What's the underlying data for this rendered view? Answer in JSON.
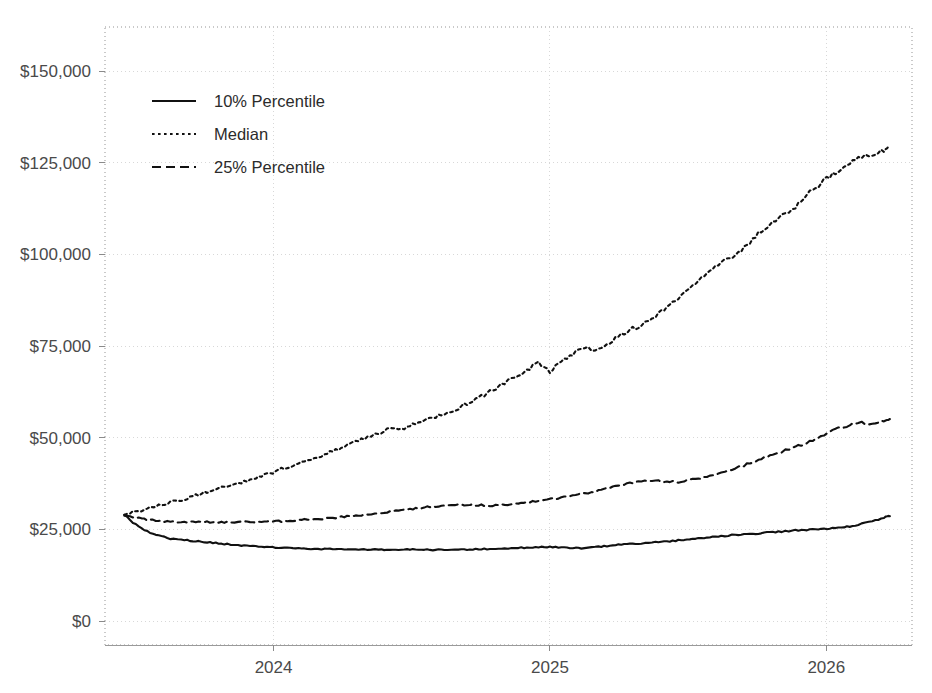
{
  "chart_data": {
    "type": "line",
    "title": "",
    "subtitle": "",
    "xlabel": "",
    "ylabel": "",
    "grid": true,
    "legend_position": "upper-left-inside",
    "x_tick_labels": [
      "2024",
      "2025",
      "2026"
    ],
    "x_tick_values": [
      2024,
      2025,
      2026
    ],
    "xlim": [
      2023.39,
      2026.31
    ],
    "y_tick_labels": [
      "$0",
      "$25,000",
      "$50,000",
      "$75,000",
      "$100,000",
      "$125,000",
      "$150,000"
    ],
    "y_tick_values": [
      0,
      25000,
      50000,
      75000,
      100000,
      125000,
      150000
    ],
    "ylim": [
      -6500,
      162000
    ],
    "y_prefix": "$",
    "x": [
      2023.46,
      2023.5,
      2023.54,
      2023.58,
      2023.62,
      2023.67,
      2023.71,
      2023.75,
      2023.79,
      2023.83,
      2023.88,
      2023.92,
      2023.96,
      2024.0,
      2024.04,
      2024.08,
      2024.12,
      2024.17,
      2024.21,
      2024.25,
      2024.29,
      2024.33,
      2024.38,
      2024.42,
      2024.46,
      2024.5,
      2024.54,
      2024.58,
      2024.62,
      2024.67,
      2024.71,
      2024.75,
      2024.79,
      2024.83,
      2024.88,
      2024.92,
      2024.96,
      2025.0,
      2025.04,
      2025.08,
      2025.12,
      2025.17,
      2025.21,
      2025.25,
      2025.29,
      2025.33,
      2025.38,
      2025.42,
      2025.46,
      2025.5,
      2025.54,
      2025.58,
      2025.62,
      2025.67,
      2025.71,
      2025.75,
      2025.79,
      2025.83,
      2025.88,
      2025.92,
      2025.96,
      2026.0,
      2026.04,
      2026.08,
      2026.12,
      2026.17,
      2026.21,
      2026.23
    ],
    "series": [
      {
        "name": "10% Percentile",
        "style": "solid",
        "color": "#111111",
        "values": [
          29000,
          26400,
          24600,
          23400,
          22600,
          22200,
          21900,
          21600,
          21300,
          21000,
          20700,
          20500,
          20300,
          20100,
          19950,
          19800,
          19750,
          19700,
          19700,
          19650,
          19600,
          19600,
          19550,
          19500,
          19500,
          19500,
          19450,
          19450,
          19500,
          19500,
          19550,
          19600,
          19700,
          19800,
          19900,
          20100,
          20200,
          20300,
          20100,
          19950,
          19850,
          20200,
          20500,
          20800,
          21000,
          21200,
          21500,
          21700,
          22000,
          22300,
          22600,
          22900,
          23200,
          23500,
          23700,
          23900,
          24200,
          24400,
          24700,
          24900,
          25000,
          25100,
          25400,
          25800,
          26400,
          27200,
          28200,
          28800
        ]
      },
      {
        "name": "Median",
        "style": "dotted",
        "color": "#111111",
        "values": [
          29200,
          29800,
          30600,
          31400,
          32300,
          33200,
          34100,
          35000,
          35900,
          36800,
          37700,
          38700,
          39700,
          40700,
          41700,
          42800,
          43900,
          45100,
          46200,
          47400,
          48600,
          49900,
          51200,
          52400,
          52100,
          53400,
          54800,
          55300,
          56700,
          58200,
          59700,
          61200,
          62900,
          64700,
          66600,
          68500,
          70600,
          68000,
          70900,
          72800,
          74600,
          73900,
          75800,
          77900,
          79400,
          80700,
          83000,
          85600,
          88000,
          90200,
          92700,
          95600,
          97700,
          99500,
          102500,
          105400,
          107800,
          109800,
          112300,
          115500,
          118300,
          120500,
          122400,
          124600,
          126200,
          127400,
          128600,
          128800
        ]
      },
      {
        "name": "25% Percentile",
        "style": "dashed",
        "color": "#111111",
        "values": [
          29000,
          28200,
          27700,
          27400,
          27200,
          27100,
          27000,
          27000,
          27000,
          27000,
          27000,
          27000,
          27100,
          27200,
          27300,
          27500,
          27700,
          27900,
          28100,
          28400,
          28700,
          29000,
          29400,
          29800,
          30200,
          30600,
          31000,
          31300,
          31600,
          31700,
          31700,
          31600,
          31500,
          31700,
          32000,
          32400,
          32800,
          33200,
          33700,
          34200,
          34800,
          35400,
          36200,
          37000,
          37700,
          38100,
          38400,
          38100,
          37900,
          38300,
          38900,
          39700,
          40600,
          41600,
          42700,
          43800,
          44900,
          46000,
          47500,
          48300,
          49600,
          51100,
          52500,
          53400,
          54200,
          53600,
          54800,
          55100
        ]
      }
    ]
  },
  "legend": {
    "items": [
      {
        "label": "10% Percentile",
        "style": "solid"
      },
      {
        "label": "Median",
        "style": "dotted"
      },
      {
        "label": "25% Percentile",
        "style": "dashed"
      }
    ]
  }
}
